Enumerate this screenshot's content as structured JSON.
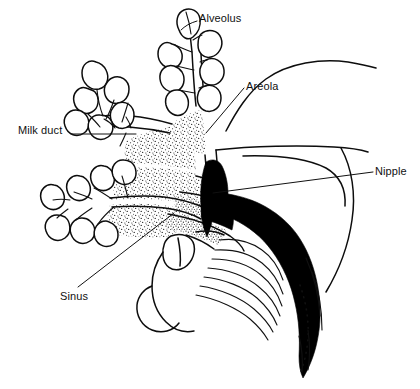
{
  "figure": {
    "background_color": "#ffffff",
    "ink_color": "#111111",
    "width": 420,
    "height": 389
  },
  "labels": {
    "alveolus": "Alveolus",
    "areola": "Areola",
    "milk_duct": "Milk duct",
    "nipple": "Nipple",
    "sinus": "Sinus"
  },
  "structures": [
    {
      "name": "alveoli-cluster-upper",
      "description": "Grape-like lobule clusters of alveoli, upper branch"
    },
    {
      "name": "alveoli-cluster-lower",
      "description": "Grape-like lobule clusters of alveoli, lower branch"
    },
    {
      "name": "milk-ducts",
      "description": "Branching ducts leading from alveoli toward the nipple"
    },
    {
      "name": "lactiferous-sinus",
      "description": "Widened duct reservoir behind the areola"
    },
    {
      "name": "areola-tissue",
      "description": "Stippled glandular and areolar tissue wedges"
    },
    {
      "name": "nipple",
      "description": "Solid black nipple elongated inside the infant mouth"
    },
    {
      "name": "infant-profile",
      "description": "Infant nose, lips, tongue and chin in profile"
    },
    {
      "name": "tongue",
      "description": "Ridged tongue surface cupping the underside of the breast"
    },
    {
      "name": "chin-dotted-line",
      "description": "Dotted outline of the infant jaw and chin"
    }
  ]
}
